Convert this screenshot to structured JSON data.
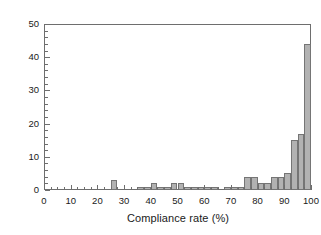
{
  "chart_data": {
    "type": "bar",
    "title": "",
    "subtitle": "",
    "xlabel": "Compliance rate (%)",
    "ylabel": "Number of patients",
    "xlim": [
      0,
      100
    ],
    "ylim": [
      0,
      50
    ],
    "bin_width": 2.5,
    "xticks": [
      0,
      10,
      20,
      30,
      40,
      50,
      60,
      70,
      80,
      90,
      100
    ],
    "yticks": [
      0,
      10,
      20,
      30,
      40,
      50
    ],
    "x_minor_tick_step": 2.5,
    "y_minor_tick_step": 2,
    "grid": false,
    "legend": null,
    "legend_position": "none",
    "bar_fill_color": "#b2b2b2",
    "bar_edge_color": "#757575",
    "axis_color": "#6e6e6e",
    "bins": [
      {
        "x0": 0.0,
        "x1": 2.5,
        "value": 0
      },
      {
        "x0": 2.5,
        "x1": 5.0,
        "value": 0
      },
      {
        "x0": 5.0,
        "x1": 7.5,
        "value": 0
      },
      {
        "x0": 7.5,
        "x1": 10.0,
        "value": 0
      },
      {
        "x0": 10.0,
        "x1": 12.5,
        "value": 0
      },
      {
        "x0": 12.5,
        "x1": 15.0,
        "value": 0
      },
      {
        "x0": 15.0,
        "x1": 17.5,
        "value": 0
      },
      {
        "x0": 17.5,
        "x1": 20.0,
        "value": 0
      },
      {
        "x0": 20.0,
        "x1": 22.5,
        "value": 0
      },
      {
        "x0": 22.5,
        "x1": 25.0,
        "value": 0
      },
      {
        "x0": 25.0,
        "x1": 27.5,
        "value": 3
      },
      {
        "x0": 27.5,
        "x1": 30.0,
        "value": 0
      },
      {
        "x0": 30.0,
        "x1": 32.5,
        "value": 0
      },
      {
        "x0": 32.5,
        "x1": 35.0,
        "value": 0
      },
      {
        "x0": 35.0,
        "x1": 37.5,
        "value": 1
      },
      {
        "x0": 37.5,
        "x1": 40.0,
        "value": 1
      },
      {
        "x0": 40.0,
        "x1": 42.5,
        "value": 2
      },
      {
        "x0": 42.5,
        "x1": 45.0,
        "value": 1
      },
      {
        "x0": 45.0,
        "x1": 47.5,
        "value": 1
      },
      {
        "x0": 47.5,
        "x1": 50.0,
        "value": 2
      },
      {
        "x0": 50.0,
        "x1": 52.5,
        "value": 2
      },
      {
        "x0": 52.5,
        "x1": 55.0,
        "value": 1
      },
      {
        "x0": 55.0,
        "x1": 57.5,
        "value": 1
      },
      {
        "x0": 57.5,
        "x1": 60.0,
        "value": 1
      },
      {
        "x0": 60.0,
        "x1": 62.5,
        "value": 1
      },
      {
        "x0": 62.5,
        "x1": 65.0,
        "value": 1
      },
      {
        "x0": 65.0,
        "x1": 67.5,
        "value": 0
      },
      {
        "x0": 67.5,
        "x1": 70.0,
        "value": 1
      },
      {
        "x0": 70.0,
        "x1": 72.5,
        "value": 1
      },
      {
        "x0": 72.5,
        "x1": 75.0,
        "value": 1
      },
      {
        "x0": 75.0,
        "x1": 77.5,
        "value": 4
      },
      {
        "x0": 77.5,
        "x1": 80.0,
        "value": 4
      },
      {
        "x0": 80.0,
        "x1": 82.5,
        "value": 2
      },
      {
        "x0": 82.5,
        "x1": 85.0,
        "value": 2
      },
      {
        "x0": 85.0,
        "x1": 87.5,
        "value": 4
      },
      {
        "x0": 87.5,
        "x1": 90.0,
        "value": 4
      },
      {
        "x0": 90.0,
        "x1": 92.5,
        "value": 5
      },
      {
        "x0": 92.5,
        "x1": 95.0,
        "value": 15
      },
      {
        "x0": 95.0,
        "x1": 97.5,
        "value": 17
      },
      {
        "x0": 97.5,
        "x1": 100.0,
        "value": 44
      }
    ]
  },
  "axes": {
    "xlabel": "Compliance rate (%)",
    "ylabel": "Number of patients",
    "xtick_labels": [
      "0",
      "10",
      "20",
      "30",
      "40",
      "50",
      "60",
      "70",
      "80",
      "90",
      "100"
    ],
    "ytick_labels": [
      "0",
      "10",
      "20",
      "30",
      "40",
      "50"
    ]
  }
}
